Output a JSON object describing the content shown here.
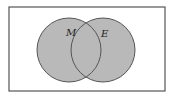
{
  "diagram": {
    "type": "venn",
    "universe": {
      "x": 9,
      "y": 7,
      "width": 156,
      "height": 84,
      "stroke": "#555555"
    },
    "sets": [
      {
        "label": "M",
        "cx": 69,
        "cy": 50,
        "r": 32,
        "fill": "#b9b9b9",
        "stroke": "#555555"
      },
      {
        "label": "E",
        "cx": 103,
        "cy": 50,
        "r": 32,
        "fill": "#b9b9b9",
        "stroke": "#555555"
      }
    ],
    "shaded": "union"
  }
}
